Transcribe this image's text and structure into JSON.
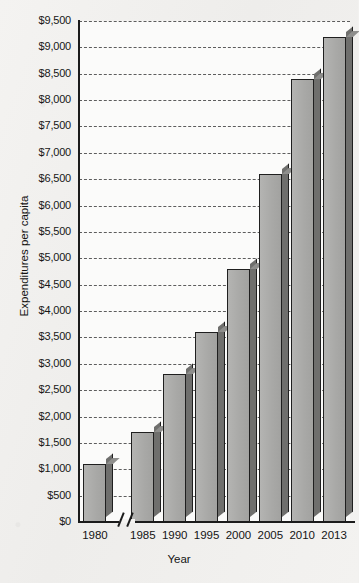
{
  "chart_data": {
    "type": "bar",
    "title": "",
    "xlabel": "Year",
    "ylabel": "Expenditures per capita",
    "categories": [
      "1980",
      "1985",
      "1990",
      "1995",
      "2000",
      "2005",
      "2010",
      "2013"
    ],
    "values": [
      1100,
      1700,
      2800,
      3600,
      4800,
      6600,
      8400,
      9200
    ],
    "value_labels": [
      "$1,100",
      "$1,700",
      "$2,800",
      "$3,600",
      "$4,800",
      "$6,600",
      "$8,400",
      "$9,200"
    ],
    "ylim": [
      0,
      9500
    ],
    "ytick_step": 500,
    "ytick_labels": [
      "$9,500",
      "$9,000",
      "$8,500",
      "$8,000",
      "$7,500",
      "$7,000",
      "$6,500",
      "$6,000",
      "$5,500",
      "$5,000",
      "$4,500",
      "$4,000",
      "$3,500",
      "$3,000",
      "$2,500",
      "$2,000",
      "$1,500",
      "$1,000",
      "$500",
      "$0"
    ],
    "ytick_values": [
      9500,
      9000,
      8500,
      8000,
      7500,
      7000,
      6500,
      6000,
      5500,
      5000,
      4500,
      4000,
      3500,
      3000,
      2500,
      2000,
      1500,
      1000,
      500,
      0
    ],
    "grid": true,
    "grid_style": "dashed-horizontal",
    "legend": null,
    "legend_position": "none",
    "axis_break": {
      "axis": "x",
      "between": [
        "1980",
        "1985"
      ],
      "symbol": "double-slash"
    },
    "colors": {
      "bar_face": "#a9a9a7",
      "bar_side": "#6f6f6d",
      "bar_top": "#8e8e8c",
      "bar_outline": "#1f1f1f",
      "gridline": "#5d5d5d",
      "axis": "#1b1b1b",
      "plot_background": "#fbfbfa",
      "page_background": "#f2f1ef",
      "text": "#141414"
    }
  }
}
